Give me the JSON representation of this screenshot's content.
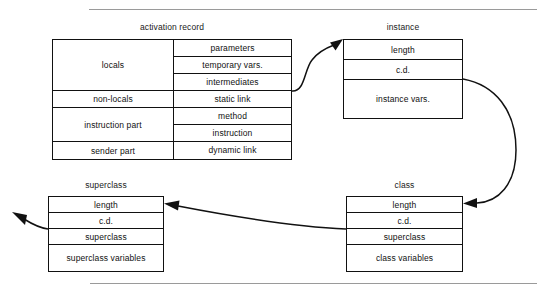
{
  "diagram": {
    "title_top_rule": "horizontal-rule",
    "boxes": [
      {
        "id": "activation-record",
        "title": "activation record",
        "left_column": [
          {
            "label": "locals",
            "span": 3
          },
          {
            "label": "non-locals",
            "span": 1
          },
          {
            "label": "instruction part",
            "span": 2
          },
          {
            "label": "sender part",
            "span": 1
          }
        ],
        "right_column": [
          {
            "label": "parameters",
            "span": 1
          },
          {
            "label": "temporary vars.",
            "span": 1
          },
          {
            "label": "intermediates",
            "span": 1
          },
          {
            "label": "static link",
            "span": 1
          },
          {
            "label": "method",
            "span": 1
          },
          {
            "label": "instruction",
            "span": 1
          },
          {
            "label": "dynamic link",
            "span": 1
          }
        ]
      },
      {
        "id": "instance",
        "title": "instance",
        "rows": [
          {
            "label": "length",
            "span": 1
          },
          {
            "label": "c.d.",
            "span": 1
          },
          {
            "label": "instance vars.",
            "span": 2
          }
        ]
      },
      {
        "id": "class",
        "title": "class",
        "rows": [
          {
            "label": "length",
            "span": 1
          },
          {
            "label": "c.d.",
            "span": 1
          },
          {
            "label": "superclass",
            "span": 1
          },
          {
            "label": "class variables",
            "span": 2
          }
        ]
      },
      {
        "id": "superclass",
        "title": "superclass",
        "rows": [
          {
            "label": "length",
            "span": 1
          },
          {
            "label": "c.d.",
            "span": 1
          },
          {
            "label": "superclass",
            "span": 1
          },
          {
            "label": "superclass variables",
            "span": 2
          }
        ]
      }
    ],
    "connections": [
      {
        "id": "static-link-to-instance",
        "from": "activation record: static link",
        "to": "instance"
      },
      {
        "id": "instance-cd-to-class",
        "from": "instance: c.d.",
        "to": "class: length"
      },
      {
        "id": "class-superclass-to-superclass",
        "from": "class: superclass",
        "to": "superclass: length"
      },
      {
        "id": "superclass-superclass-outgoing",
        "from": "superclass: superclass",
        "to": "off-diagram"
      }
    ],
    "colors": {
      "stroke": "#111111",
      "rule": "#9a9a9a",
      "background": "#ffffff",
      "text": "#111111"
    }
  }
}
